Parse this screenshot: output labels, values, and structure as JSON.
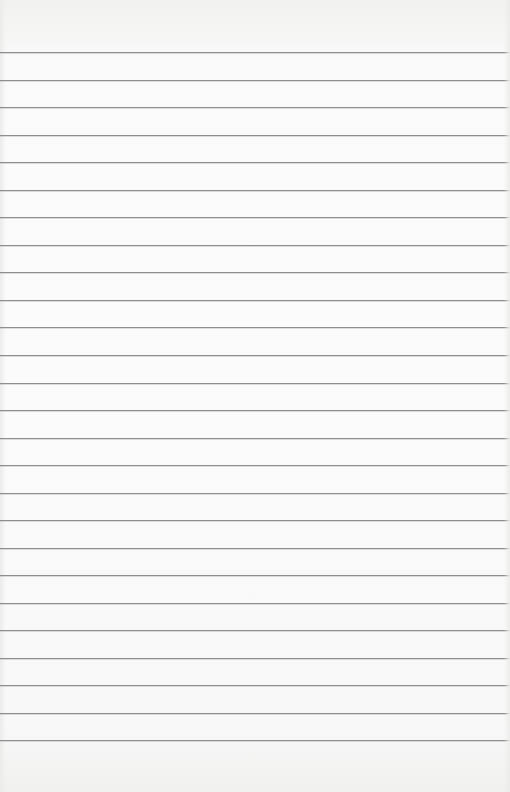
{
  "document": {
    "type": "lined-paper",
    "content": "",
    "rule_color": "#8e8e8e",
    "paper_color": "#fafafa",
    "rules_y": [
      52,
      80,
      107,
      135,
      162,
      190,
      217,
      245,
      272,
      300,
      327,
      355,
      383,
      410,
      438,
      465,
      493,
      520,
      548,
      575,
      603,
      630,
      658,
      685,
      713,
      740
    ]
  }
}
